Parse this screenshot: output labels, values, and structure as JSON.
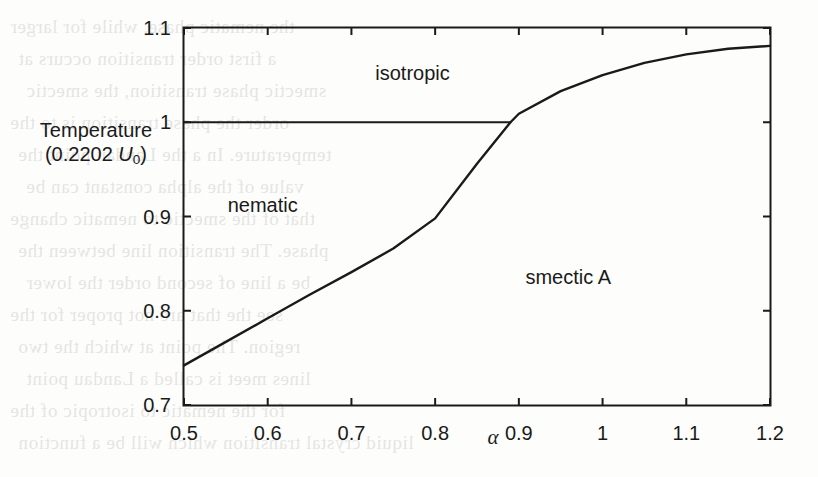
{
  "figure": {
    "name": "liquid-crystal-phase-diagram",
    "background_color": "#fdfdfc",
    "line_color": "#1a1a1a"
  },
  "chart_data": {
    "type": "line",
    "title": "",
    "subtitle": "",
    "xlabel": "α",
    "ylabel": "Temperature (0.2202 U0)",
    "ylabel_line1": "Temperature",
    "ylabel_line2_prefix": "(0.2202 ",
    "ylabel_line2_symbol": "U",
    "ylabel_line2_subscript": "0",
    "ylabel_line2_suffix": ")",
    "xlim": [
      0.5,
      1.2
    ],
    "ylim": [
      0.7,
      1.1
    ],
    "grid": false,
    "legend": "none",
    "xticks": [
      0.5,
      0.6,
      0.7,
      0.8,
      0.9,
      1,
      1.1,
      1.2
    ],
    "xticklabels": [
      "0.5",
      "0.6",
      "0.7",
      "0.8",
      "0.9",
      "1",
      "1.1",
      "1.2"
    ],
    "yticks": [
      0.7,
      0.8,
      0.9,
      1,
      1.1
    ],
    "yticklabels": [
      "0.7",
      "0.8",
      "0.9",
      "1",
      "1.1"
    ],
    "series": [
      {
        "name": "nematic-smectic-A transition",
        "style": "solid",
        "x": [
          0.5,
          0.55,
          0.6,
          0.65,
          0.7,
          0.75,
          0.8,
          0.85,
          0.89,
          0.9,
          0.95,
          1.0,
          1.05,
          1.1,
          1.15,
          1.2
        ],
        "y": [
          0.742,
          0.767,
          0.792,
          0.817,
          0.841,
          0.866,
          0.898,
          0.956,
          1.0,
          1.009,
          1.033,
          1.05,
          1.063,
          1.072,
          1.078,
          1.081
        ]
      },
      {
        "name": "nematic-isotropic transition",
        "style": "solid",
        "x": [
          0.5,
          0.89
        ],
        "y": [
          1.0,
          1.0
        ]
      }
    ],
    "annotations": [
      {
        "text": "isotropic",
        "x": 0.773,
        "y": 1.052
      },
      {
        "text": "nematic",
        "x": 0.594,
        "y": 0.912
      },
      {
        "text": "smectic A",
        "x": 0.959,
        "y": 0.836
      }
    ]
  },
  "scan_artifacts": {
    "ghost_text_lines": [
      "the nematic phase, while for larger",
      "a first order transition occurs at",
      "smectic phase transition, the smectic",
      "order the phase transition is to the",
      "temperature. In a the Landau point the",
      "value of the alpha constant can be",
      "that of the smectic to nematic change",
      "phase. The transition line between the",
      "be a line of second order the lower",
      "see the that are not proper for the",
      "region. The point at which the two",
      "lines meet is called a Landau point",
      "for the nematic to isotropic of the",
      "liquid crystal transition which will be a function"
    ]
  }
}
